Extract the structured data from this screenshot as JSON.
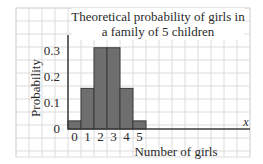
{
  "chart_data": {
    "type": "bar",
    "title": "Theoretical probability of girls in a family of 5 children",
    "title_lines": [
      "Theoretical probability of girls in",
      "a family of 5 children"
    ],
    "xlabel": "Number of girls",
    "ylabel": "Probability",
    "x_axis_symbol": "x",
    "categories": [
      "0",
      "1",
      "2",
      "3",
      "4",
      "5"
    ],
    "values": [
      0.03125,
      0.15625,
      0.3125,
      0.3125,
      0.15625,
      0.03125
    ],
    "yticks": [
      "0",
      "0.1",
      "0.2",
      "0.3"
    ],
    "ytick_values": [
      0,
      0.1,
      0.2,
      0.3
    ],
    "ylim": [
      0,
      0.35
    ],
    "grid": true,
    "legend": null,
    "bar_color": "#6e6e6e",
    "bar_edge_color": "#3a3a3a",
    "grid_color": "#dcdcdc",
    "axis_color": "#3a3a3a"
  }
}
